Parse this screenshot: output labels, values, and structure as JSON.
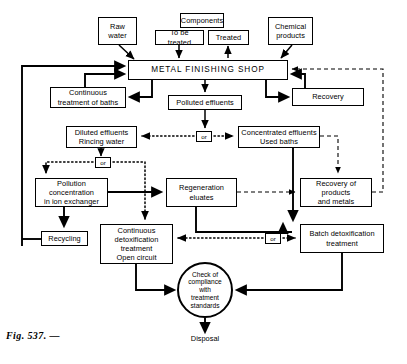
{
  "figure": {
    "caption": "Fig. 537. —"
  },
  "nodes": {
    "raw_water": "Raw\nwater",
    "components": "Components",
    "to_be_treated": "To be treated",
    "treated": "Treated",
    "chemical_products": "Chemical\nproducts",
    "metal_finishing_shop": "METAL FINISHING SHOP",
    "continuous_treatment_of_baths": "Continuous\ntreatment of baths",
    "polluted_effluents": "Polluted effluents",
    "recovery": "Recovery",
    "diluted_effluents": "Diluted effluents\nRincing water",
    "concentrated_effluents": "Concentrated effluents\nUsed baths",
    "pollution_concentration": "Pollution\nconcentration\nin ion exchanger",
    "regeneration_eluates": "Regeneration\neluates",
    "recovery_products_metals": "Recovery of\nproducts\nand metals",
    "recycling": "Recycling",
    "continuous_detox": "Continuous\ndetoxification\ntreatment\nOpen circuit",
    "batch_detox": "Batch detoxification\ntreatment",
    "check_compliance": "Check of\ncompliance\nwith\ntreatment\nstandards",
    "disposal": "Disposal",
    "or_1": "or",
    "or_2": "or",
    "or_3": "or"
  },
  "colors": {
    "line": "#000000",
    "background": "#ffffff",
    "text": "#000000"
  },
  "chart_data": {
    "type": "diagram",
    "boxes": [
      {
        "id": "raw_water",
        "label": "Raw water",
        "x": 98,
        "y": 17,
        "w": 39,
        "h": 28
      },
      {
        "id": "components",
        "label": "Components",
        "x": 180,
        "y": 13,
        "w": 44,
        "h": 15
      },
      {
        "id": "to_be_treated",
        "label": "To be treated",
        "x": 155,
        "y": 30,
        "w": 49,
        "h": 15
      },
      {
        "id": "treated",
        "label": "Treated",
        "x": 208,
        "y": 30,
        "w": 41,
        "h": 15
      },
      {
        "id": "chemical_products",
        "label": "Chemical products",
        "x": 268,
        "y": 17,
        "w": 45,
        "h": 28
      },
      {
        "id": "metal_finishing_shop",
        "label": "METAL FINISHING SHOP",
        "x": 128,
        "y": 60,
        "w": 160,
        "h": 20
      },
      {
        "id": "continuous_treatment_of_baths",
        "label": "Continuous treatment of baths",
        "x": 50,
        "y": 87,
        "w": 76,
        "h": 21
      },
      {
        "id": "polluted_effluents",
        "label": "Polluted effluents",
        "x": 168,
        "y": 95,
        "w": 74,
        "h": 15
      },
      {
        "id": "recovery",
        "label": "Recovery",
        "x": 292,
        "y": 88,
        "w": 72,
        "h": 18
      },
      {
        "id": "diluted_effluents",
        "label": "Diluted effluents Rincing water",
        "x": 66,
        "y": 126,
        "w": 71,
        "h": 22
      },
      {
        "id": "concentrated_effluents",
        "label": "Concentrated effluents Used baths",
        "x": 238,
        "y": 126,
        "w": 82,
        "h": 22
      },
      {
        "id": "pollution_concentration",
        "label": "Pollution concentration in ion exchanger",
        "x": 35,
        "y": 178,
        "w": 73,
        "h": 29
      },
      {
        "id": "regeneration_eluates",
        "label": "Regeneration eluates",
        "x": 166,
        "y": 178,
        "w": 71,
        "h": 29
      },
      {
        "id": "recovery_products_metals",
        "label": "Recovery of products and metals",
        "x": 300,
        "y": 178,
        "w": 72,
        "h": 29
      },
      {
        "id": "recycling",
        "label": "Recycling",
        "x": 41,
        "y": 231,
        "w": 47,
        "h": 15
      },
      {
        "id": "continuous_detox",
        "label": "Continuous detoxification treatment Open circuit",
        "x": 100,
        "y": 224,
        "w": 73,
        "h": 40
      },
      {
        "id": "batch_detox",
        "label": "Batch detoxification treatment",
        "x": 300,
        "y": 224,
        "w": 84,
        "h": 29
      },
      {
        "id": "check_compliance",
        "label": "Check of compliance with treatment standards",
        "shape": "circle",
        "cx": 205,
        "cy": 290,
        "r": 28
      },
      {
        "id": "disposal",
        "label": "Disposal",
        "shape": "text",
        "x": 205,
        "y": 340
      }
    ],
    "or_junctions": [
      {
        "id": "or_1",
        "x": 196,
        "y": 131,
        "w": 16,
        "h": 11
      },
      {
        "id": "or_2",
        "x": 95,
        "y": 157,
        "w": 16,
        "h": 11
      },
      {
        "id": "or_3",
        "x": 265,
        "y": 233,
        "w": 16,
        "h": 11
      }
    ],
    "edge_styles": [
      "solid-thin",
      "solid-thick",
      "dashed",
      "dotted"
    ]
  }
}
